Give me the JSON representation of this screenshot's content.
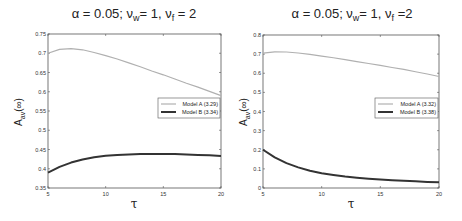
{
  "figure": {
    "panels": [
      {
        "title": "α = 0.05;  ν_w = 1,  ν_f = 2",
        "title_parts": {
          "prefix": "α = 0.05;  ν",
          "sub1": "w",
          "mid": "= 1,  ν",
          "sub2": "f",
          "suffix": " = 2"
        },
        "xlabel": "τ",
        "ylabel": "A_av(∞)",
        "ylabel_parts": {
          "main": "A",
          "sub": "av",
          "suffix": "(∞)"
        }
      },
      {
        "title": "α = 0.05;  ν_w = 1,  ν_f =2",
        "title_parts": {
          "prefix": "α = 0.05;  ν",
          "sub1": "w",
          "mid": "= 1,  ν",
          "sub2": "f",
          "suffix": " =2"
        },
        "xlabel": "τ",
        "ylabel": "A_av(∞)",
        "ylabel_parts": {
          "main": "A",
          "sub": "av",
          "suffix": "(∞)"
        }
      }
    ]
  },
  "chart_data": [
    {
      "type": "line",
      "title": "α = 0.05; ν_w = 1, ν_f = 2",
      "xlabel": "τ",
      "ylabel": "A_av(∞)",
      "xlim": [
        5,
        20
      ],
      "ylim": [
        0.35,
        0.75
      ],
      "xticks": [
        5,
        10,
        15,
        20
      ],
      "yticks": [
        0.35,
        0.4,
        0.45,
        0.5,
        0.55,
        0.6,
        0.65,
        0.7,
        0.75
      ],
      "ytick_labels": [
        "0.35",
        "0.4",
        "0.45",
        "0.5",
        "0.55",
        "0.6",
        "0.65",
        "0.7",
        "0.75"
      ],
      "grid": false,
      "legend_position": "right-middle",
      "x": [
        5,
        6,
        7,
        8,
        9,
        10,
        11,
        12,
        13,
        14,
        15,
        16,
        17,
        18,
        19,
        20
      ],
      "series": [
        {
          "name": "Model A (3.29)",
          "color": "#b0b0b0",
          "width": 1.2,
          "values": [
            0.7,
            0.71,
            0.712,
            0.709,
            0.702,
            0.694,
            0.685,
            0.675,
            0.665,
            0.654,
            0.644,
            0.633,
            0.622,
            0.612,
            0.601,
            0.59
          ]
        },
        {
          "name": "Model B (3.34)",
          "color": "#333333",
          "width": 2,
          "values": [
            0.39,
            0.405,
            0.416,
            0.424,
            0.43,
            0.434,
            0.436,
            0.437,
            0.438,
            0.438,
            0.438,
            0.438,
            0.437,
            0.436,
            0.435,
            0.433
          ]
        }
      ]
    },
    {
      "type": "line",
      "title": "α = 0.05; ν_w = 1, ν_f =2",
      "xlabel": "τ",
      "ylabel": "A_av(∞)",
      "xlim": [
        5,
        20
      ],
      "ylim": [
        0,
        0.8
      ],
      "xticks": [
        5,
        10,
        15,
        20
      ],
      "yticks": [
        0,
        0.1,
        0.2,
        0.3,
        0.4,
        0.5,
        0.6,
        0.7,
        0.8
      ],
      "ytick_labels": [
        "0",
        "0.1",
        "0.2",
        "0.3",
        "0.4",
        "0.5",
        "0.6",
        "0.7",
        "0.8"
      ],
      "grid": false,
      "legend_position": "right-middle",
      "x": [
        5,
        6,
        7,
        8,
        9,
        10,
        11,
        12,
        13,
        14,
        15,
        16,
        17,
        18,
        19,
        20
      ],
      "series": [
        {
          "name": "Model A (3.32)",
          "color": "#b0b0b0",
          "width": 1.2,
          "values": [
            0.705,
            0.712,
            0.711,
            0.706,
            0.699,
            0.69,
            0.681,
            0.671,
            0.661,
            0.651,
            0.641,
            0.63,
            0.62,
            0.608,
            0.596,
            0.583
          ]
        },
        {
          "name": "Model B (3.38)",
          "color": "#333333",
          "width": 2,
          "values": [
            0.2,
            0.16,
            0.13,
            0.108,
            0.09,
            0.077,
            0.068,
            0.06,
            0.054,
            0.049,
            0.045,
            0.041,
            0.038,
            0.035,
            0.032,
            0.03
          ]
        }
      ]
    }
  ]
}
